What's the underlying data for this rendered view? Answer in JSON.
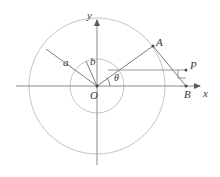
{
  "figure": {
    "background_color": "#ffffff",
    "stroke_color": "#6e6e6e",
    "circle_color": "#b9b9b9",
    "label_color": "#3a3a3a",
    "width": 220,
    "height": 177
  },
  "axes": {
    "x_label": "x",
    "y_label": "y",
    "origin_label": "O",
    "origin": {
      "x": 97,
      "y": 86
    },
    "x_axis": {
      "x1": 16,
      "y1": 86,
      "x2": 205,
      "y2": 86
    },
    "y_axis": {
      "x1": 97,
      "y1": 163,
      "x2": 97,
      "y2": 16
    }
  },
  "circles": [
    {
      "name": "outer-circle",
      "cx": 97,
      "cy": 86,
      "r": 68,
      "radius_label": "a"
    },
    {
      "name": "inner-circle",
      "cx": 97,
      "cy": 86,
      "r": 27,
      "radius_label": "b"
    }
  ],
  "points": [
    {
      "name": "A",
      "label": "A",
      "x": 152,
      "y": 47
    },
    {
      "name": "P",
      "label": "P",
      "x": 186,
      "y": 68
    },
    {
      "name": "B",
      "label": "B",
      "x": 186,
      "y": 86
    },
    {
      "name": "O",
      "label": "O",
      "x": 97,
      "y": 86
    }
  ],
  "segments": [
    {
      "name": "radius-a",
      "from": "O",
      "to": "outer-circle-upper-left",
      "x1": 97,
      "y1": 86,
      "x2": 47,
      "y2": 50
    },
    {
      "name": "radius-b",
      "from": "O",
      "to": "inner-circle-upper-left",
      "x1": 97,
      "y1": 86,
      "x2": 86,
      "y2": 61
    },
    {
      "name": "segment-OA",
      "from": "O",
      "to": "A",
      "x1": 97,
      "y1": 86,
      "x2": 152,
      "y2": 47
    },
    {
      "name": "segment-AB",
      "from": "A",
      "to": "B",
      "x1": 152,
      "y1": 47,
      "x2": 186,
      "y2": 86
    },
    {
      "name": "segment-horizontal-to-P",
      "from": "OA-intersection",
      "to": "P",
      "x1": 108,
      "y1": 70,
      "x2": 186,
      "y2": 70
    }
  ],
  "angle_labels": [
    {
      "name": "angle-theta",
      "label": "θ",
      "x": 115,
      "y": 77
    },
    {
      "name": "radius-label-a",
      "label": "a",
      "x": 64,
      "y": 63
    },
    {
      "name": "radius-label-b",
      "label": "b",
      "x": 91,
      "y": 62
    }
  ],
  "markers": {
    "right_angle_at_P": {
      "name": "right-angle-marker",
      "x": 178,
      "y": 70,
      "size": 8
    },
    "arrow_heads": [
      "x-axis-arrow",
      "y-axis-arrow"
    ]
  }
}
